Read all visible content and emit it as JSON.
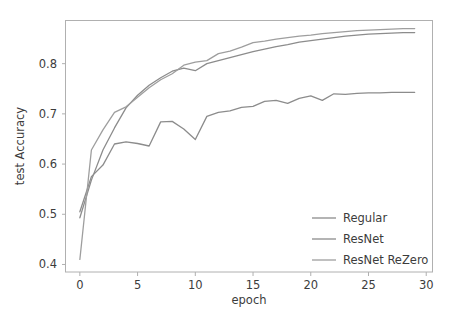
{
  "chart_data": {
    "type": "line",
    "title": "",
    "xlabel": "epoch",
    "ylabel": "test Accuracy",
    "xlim": [
      -1.2,
      30.5
    ],
    "ylim": [
      0.385,
      0.885
    ],
    "xticks": [
      0,
      5,
      10,
      15,
      20,
      25,
      30
    ],
    "xtick_labels": [
      "0",
      "5",
      "10",
      "15",
      "20",
      "25",
      "30"
    ],
    "yticks": [
      0.4,
      0.5,
      0.6,
      0.7,
      0.8
    ],
    "ytick_labels": [
      "0.4",
      "0.5",
      "0.6",
      "0.7",
      "0.8"
    ],
    "grid": false,
    "legend_position": "lower right",
    "x": [
      0,
      1,
      2,
      3,
      4,
      5,
      6,
      7,
      8,
      9,
      10,
      11,
      12,
      13,
      14,
      15,
      16,
      17,
      18,
      19,
      20,
      21,
      22,
      23,
      24,
      25,
      26,
      27,
      28,
      29
    ],
    "series": [
      {
        "name": "Regular",
        "color": "#8c8c8c",
        "values": [
          0.505,
          0.575,
          0.598,
          0.64,
          0.644,
          0.641,
          0.636,
          0.684,
          0.685,
          0.67,
          0.649,
          0.695,
          0.703,
          0.706,
          0.713,
          0.715,
          0.725,
          0.727,
          0.721,
          0.731,
          0.736,
          0.727,
          0.74,
          0.739,
          0.741,
          0.742,
          0.742,
          0.743,
          0.743,
          0.743
        ]
      },
      {
        "name": "ResNet",
        "color": "#8c8c8c",
        "values": [
          0.493,
          0.568,
          0.628,
          0.672,
          0.712,
          0.737,
          0.757,
          0.772,
          0.785,
          0.791,
          0.786,
          0.8,
          0.806,
          0.812,
          0.818,
          0.824,
          0.829,
          0.834,
          0.838,
          0.843,
          0.846,
          0.849,
          0.852,
          0.855,
          0.857,
          0.859,
          0.86,
          0.861,
          0.862,
          0.862
        ]
      },
      {
        "name": "ResNet ReZero",
        "color": "#9e9e9e",
        "values": [
          0.41,
          0.628,
          0.668,
          0.703,
          0.714,
          0.733,
          0.752,
          0.768,
          0.78,
          0.797,
          0.803,
          0.806,
          0.82,
          0.825,
          0.833,
          0.842,
          0.845,
          0.849,
          0.852,
          0.855,
          0.857,
          0.86,
          0.862,
          0.864,
          0.866,
          0.867,
          0.868,
          0.869,
          0.87,
          0.87
        ]
      }
    ]
  },
  "legend": {
    "items": [
      {
        "label": "Regular"
      },
      {
        "label": "ResNet"
      },
      {
        "label": "ResNet ReZero"
      }
    ]
  },
  "colors": {
    "background": "#ffffff",
    "spine": "#b0b0b0",
    "text": "#3c3c3c"
  }
}
